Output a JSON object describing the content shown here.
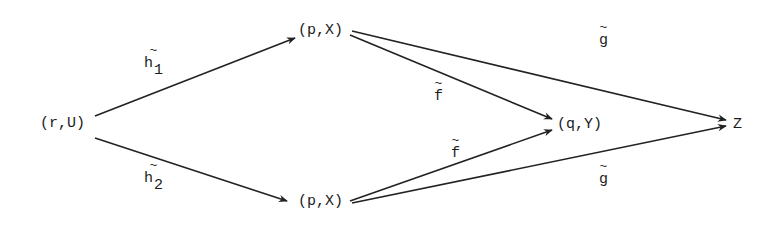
{
  "diagram": {
    "type": "commutative-diagram",
    "nodes": {
      "rU": {
        "label": "(r,U)"
      },
      "pX_top": {
        "label": "(p,X)"
      },
      "pX_bottom": {
        "label": "(p,X)"
      },
      "qY": {
        "label": "(q,Y)"
      },
      "Z": {
        "label": "Z"
      }
    },
    "labels": {
      "h1": {
        "tilde": "~",
        "base": "h",
        "sub": "1"
      },
      "h2": {
        "tilde": "~",
        "base": "h",
        "sub": "2"
      },
      "f_top": {
        "tilde": "~",
        "base": "f"
      },
      "f_bottom": {
        "tilde": "~",
        "base": "f"
      },
      "g_top": {
        "tilde": "~",
        "base": "g"
      },
      "g_bottom": {
        "tilde": "~",
        "base": "g"
      }
    },
    "edges": [
      {
        "from": "(r,U)",
        "to": "(p,X) top",
        "label": "h̃1"
      },
      {
        "from": "(r,U)",
        "to": "(p,X) bottom",
        "label": "h̃2"
      },
      {
        "from": "(p,X) top",
        "to": "(q,Y)",
        "label": "f̃"
      },
      {
        "from": "(p,X) bottom",
        "to": "(q,Y)",
        "label": "f̃"
      },
      {
        "from": "(p,X) top",
        "to": "Z",
        "label": "g̃"
      },
      {
        "from": "(p,X) bottom",
        "to": "Z",
        "label": "g̃"
      }
    ],
    "colors": {
      "ink": "#1c1c1c",
      "background": "#ffffff"
    }
  }
}
